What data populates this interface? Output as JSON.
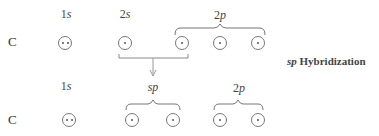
{
  "diagram": {
    "title_italic": "sp",
    "title_rest": " Hybridization",
    "before": {
      "atom": "C",
      "labels": [
        {
          "num": "1",
          "sub": "s"
        },
        {
          "num": "2",
          "sub": "s"
        },
        {
          "num": "2",
          "sub": "p"
        }
      ],
      "orbitals": [
        {
          "name": "1s",
          "electrons": 2
        },
        {
          "name": "2s",
          "electrons": 1
        },
        {
          "name": "2p-1",
          "electrons": 1
        },
        {
          "name": "2p-2",
          "electrons": 1
        },
        {
          "name": "2p-3",
          "electrons": 1
        }
      ]
    },
    "after": {
      "atom": "C",
      "labels": [
        {
          "num": "1",
          "sub": "s"
        },
        {
          "num": "",
          "sub": "sp"
        },
        {
          "num": "2",
          "sub": "p"
        }
      ],
      "orbitals": [
        {
          "name": "1s",
          "electrons": 2
        },
        {
          "name": "sp-1",
          "electrons": 1
        },
        {
          "name": "sp-2",
          "electrons": 1
        },
        {
          "name": "2p-1",
          "electrons": 1
        },
        {
          "name": "2p-2",
          "electrons": 1
        }
      ]
    },
    "colors": {
      "line": "#777777",
      "text": "#444444"
    }
  }
}
